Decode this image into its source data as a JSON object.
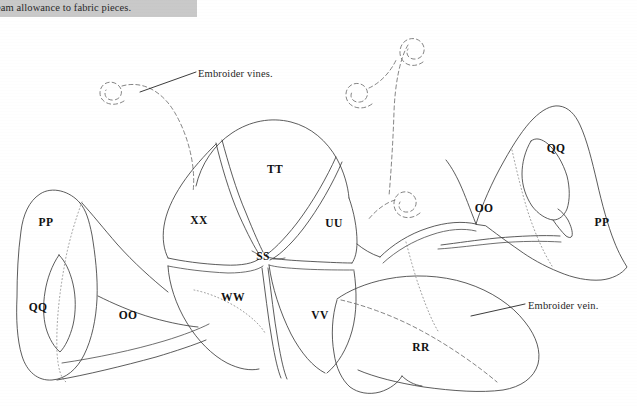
{
  "page": {
    "width": 637,
    "height": 406,
    "background_color": "#ffffff",
    "ink_color": "#3a3a3a",
    "label_color": "#111111"
  },
  "header": {
    "bar_color": "#c9c9c9",
    "caption": "eam allowance to fabric pieces."
  },
  "annotations": [
    {
      "id": "vines",
      "text": "Embroider vines.",
      "x": 198,
      "y": 73
    },
    {
      "id": "vein",
      "text": "Embroider vein.",
      "x": 528,
      "y": 305
    }
  ],
  "pieces": [
    {
      "id": "pp-left",
      "label": "PP",
      "x": 46,
      "y": 222
    },
    {
      "id": "qq-left",
      "label": "QQ",
      "x": 38,
      "y": 307
    },
    {
      "id": "oo-left",
      "label": "OO",
      "x": 128,
      "y": 315
    },
    {
      "id": "xx",
      "label": "XX",
      "x": 199,
      "y": 220
    },
    {
      "id": "tt",
      "label": "TT",
      "x": 275,
      "y": 169
    },
    {
      "id": "uu",
      "label": "UU",
      "x": 334,
      "y": 223
    },
    {
      "id": "ss",
      "label": "SS",
      "x": 263,
      "y": 256
    },
    {
      "id": "ww",
      "label": "WW",
      "x": 233,
      "y": 297
    },
    {
      "id": "vv",
      "label": "VV",
      "x": 320,
      "y": 315
    },
    {
      "id": "rr",
      "label": "RR",
      "x": 421,
      "y": 347
    },
    {
      "id": "oo-right",
      "label": "OO",
      "x": 484,
      "y": 208
    },
    {
      "id": "qq-right",
      "label": "QQ",
      "x": 556,
      "y": 148
    },
    {
      "id": "pp-right",
      "label": "PP",
      "x": 602,
      "y": 222
    }
  ]
}
